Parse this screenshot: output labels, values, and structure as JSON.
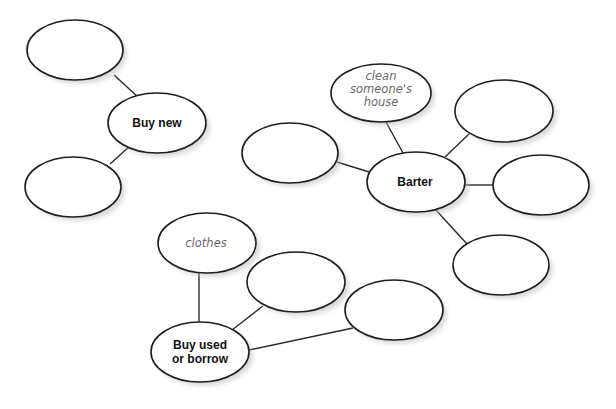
{
  "diagram": {
    "type": "mind-map",
    "background": "#ffffff",
    "clusters": [
      {
        "id": "buy-new",
        "center": {
          "label_lines": [
            "Buy new"
          ],
          "cx": 157,
          "cy": 123
        },
        "branches": [
          {
            "label_lines": [],
            "cx": 75,
            "cy": 50,
            "line": [
              114,
              75,
              138,
              97
            ]
          },
          {
            "label_lines": [],
            "cx": 73,
            "cy": 187,
            "line": [
              130,
              146,
              110,
              164
            ]
          }
        ]
      },
      {
        "id": "barter",
        "center": {
          "label_lines": [
            "Barter"
          ],
          "cx": 416,
          "cy": 182
        },
        "branches": [
          {
            "label_lines": [
              "clean",
              "someone's",
              "house"
            ],
            "cx": 381,
            "cy": 93,
            "line": [
              386,
              122,
              403,
              153
            ]
          },
          {
            "label_lines": [],
            "cx": 504,
            "cy": 111,
            "line": [
              469,
              134,
              445,
              157
            ]
          },
          {
            "label_lines": [],
            "cx": 290,
            "cy": 153,
            "line": [
              337,
              162,
              369,
              172
            ]
          },
          {
            "label_lines": [],
            "cx": 541,
            "cy": 185,
            "line": [
              464,
              185,
              493,
              185
            ]
          },
          {
            "label_lines": [],
            "cx": 501,
            "cy": 265,
            "line": [
              435,
              209,
              467,
              244
            ]
          }
        ]
      },
      {
        "id": "buy-used-or-borrow",
        "center": {
          "label_lines": [
            "Buy used",
            "or borrow"
          ],
          "cx": 200,
          "cy": 352
        },
        "branches": [
          {
            "label_lines": [
              "clothes"
            ],
            "cx": 207,
            "cy": 243,
            "line": [
              199,
              273,
              199,
              323
            ]
          },
          {
            "label_lines": [],
            "cx": 296,
            "cy": 282,
            "line": [
              263,
              306,
              232,
              330
            ]
          },
          {
            "label_lines": [],
            "cx": 394,
            "cy": 310,
            "line": [
              353,
              328,
              249,
              350
            ]
          }
        ]
      }
    ],
    "ellipse": {
      "rx": 49,
      "ry": 30
    },
    "colors": {
      "stroke": "#1e1e1e",
      "fill": "#ffffff",
      "center_text": "#111111",
      "branch_text": "#6a6a6a"
    }
  },
  "labels": {
    "buy_new": "Buy new",
    "barter": "Barter",
    "buy_used_line1": "Buy used",
    "buy_used_line2": "or borrow",
    "clean_line1": "clean",
    "clean_line2": "someone's",
    "clean_line3": "house",
    "clothes": "clothes"
  }
}
